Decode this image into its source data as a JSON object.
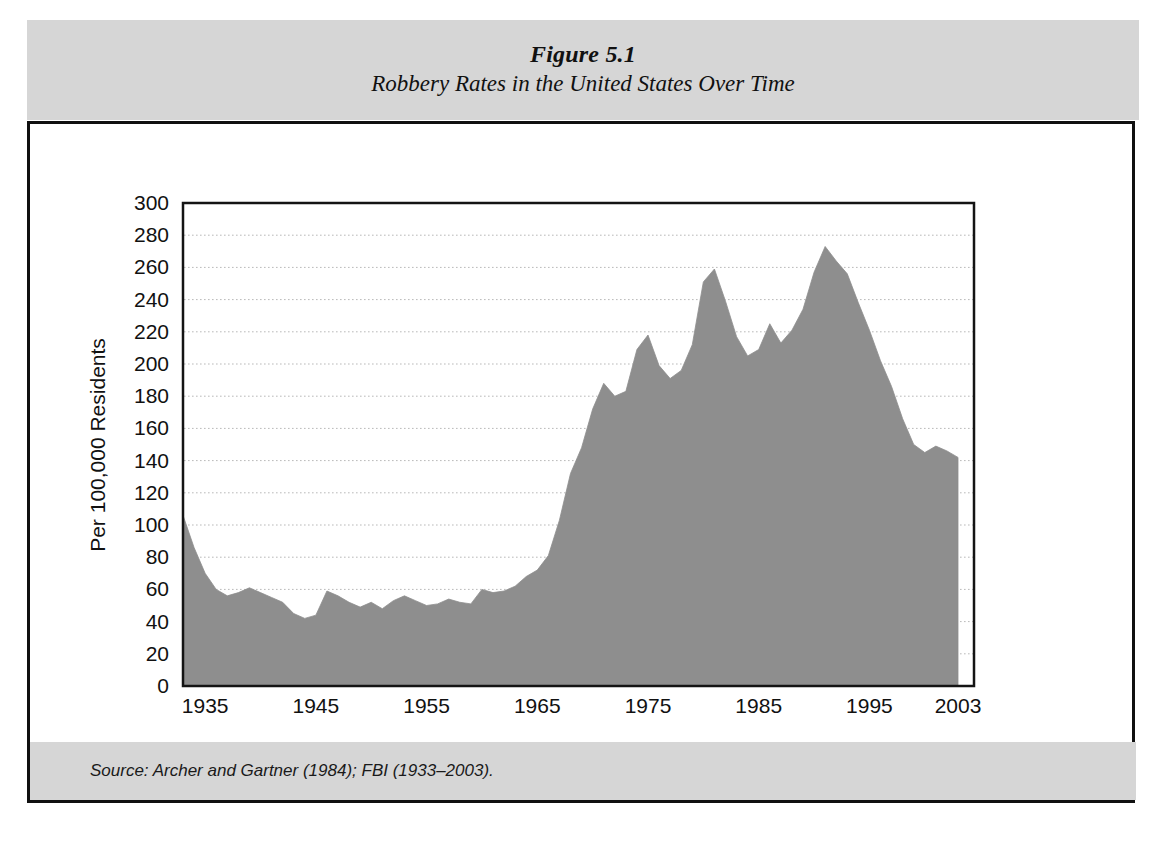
{
  "figure": {
    "title_line1": "Figure 5.1",
    "title_line2": "Robbery Rates in the United States Over Time",
    "source": "Source: Archer and Gartner (1984); FBI (1933–2003).",
    "band_color": "#d6d6d6",
    "frame_color": "#101010",
    "area_fill": "#8e8e8e",
    "page_background": "#ffffff"
  },
  "chart_data": {
    "type": "area",
    "title": "Robbery Rates in the United States Over Time",
    "subtitle": "Figure 5.1",
    "xlabel": "",
    "ylabel": "Per 100,000 Residents",
    "xlim": [
      1933,
      2003
    ],
    "ylim": [
      0,
      300
    ],
    "grid": true,
    "grid_style": "dotted-horizontal",
    "legend": "none",
    "y_ticks": [
      0,
      20,
      40,
      60,
      80,
      100,
      120,
      140,
      160,
      180,
      200,
      220,
      240,
      260,
      280,
      300
    ],
    "x_ticks": [
      1935,
      1945,
      1955,
      1965,
      1975,
      1985,
      1995,
      2003
    ],
    "x": [
      1933,
      1934,
      1935,
      1936,
      1937,
      1938,
      1939,
      1940,
      1941,
      1942,
      1943,
      1944,
      1945,
      1946,
      1947,
      1948,
      1949,
      1950,
      1951,
      1952,
      1953,
      1954,
      1955,
      1956,
      1957,
      1958,
      1959,
      1960,
      1961,
      1962,
      1963,
      1964,
      1965,
      1966,
      1967,
      1968,
      1969,
      1970,
      1971,
      1972,
      1973,
      1974,
      1975,
      1976,
      1977,
      1978,
      1979,
      1980,
      1981,
      1982,
      1983,
      1984,
      1985,
      1986,
      1987,
      1988,
      1989,
      1990,
      1991,
      1992,
      1993,
      1994,
      1995,
      1996,
      1997,
      1998,
      1999,
      2000,
      2001,
      2002,
      2003
    ],
    "values": [
      106,
      86,
      70,
      60,
      56,
      58,
      61,
      58,
      55,
      52,
      45,
      42,
      44,
      59,
      56,
      52,
      49,
      52,
      48,
      53,
      56,
      53,
      50,
      51,
      54,
      52,
      51,
      60,
      58,
      59,
      62,
      68,
      72,
      81,
      103,
      132,
      148,
      172,
      188,
      180,
      183,
      209,
      218,
      199,
      191,
      196,
      212,
      251,
      259,
      239,
      217,
      205,
      209,
      225,
      213,
      221,
      234,
      257,
      273,
      264,
      256,
      238,
      221,
      202,
      186,
      166,
      150,
      145,
      149,
      146,
      142
    ]
  }
}
